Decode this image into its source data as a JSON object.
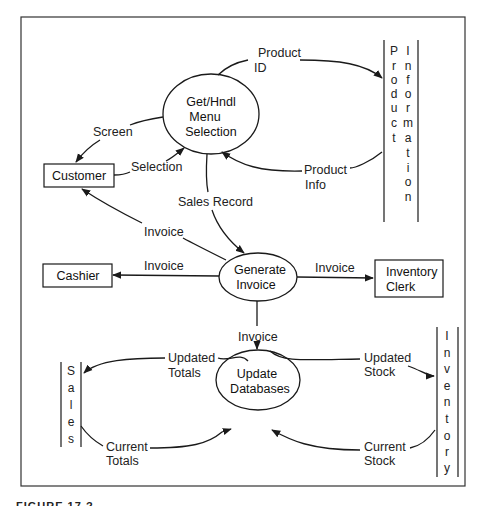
{
  "diagram": {
    "type": "data-flow-diagram",
    "processes": [
      {
        "id": "p1",
        "lines": [
          "Get/Hndl",
          "Menu",
          "Selection"
        ]
      },
      {
        "id": "p2",
        "lines": [
          "Generate",
          "Invoice"
        ]
      },
      {
        "id": "p3",
        "lines": [
          "Update",
          "Databases"
        ]
      }
    ],
    "entities": [
      {
        "id": "customer",
        "lines": [
          "Customer"
        ]
      },
      {
        "id": "cashier",
        "lines": [
          "Cashier"
        ]
      },
      {
        "id": "inventory_clerk",
        "lines": [
          "Inventory",
          "Clerk"
        ]
      }
    ],
    "stores": [
      {
        "id": "product_information",
        "columns": [
          [
            "P",
            "r",
            "o",
            "d",
            "u",
            "c",
            "t"
          ],
          [
            "I",
            "n",
            "f",
            "o",
            "r",
            "m",
            "a",
            "t",
            "i",
            "o",
            "n"
          ]
        ]
      },
      {
        "id": "sales",
        "columns": [
          [
            "S",
            "a",
            "l",
            "e",
            "s"
          ]
        ]
      },
      {
        "id": "inventory",
        "columns": [
          [
            "I",
            "n",
            "v",
            "e",
            "n",
            "t",
            "o",
            "r",
            "y"
          ]
        ]
      }
    ],
    "flows": [
      {
        "from": "p1",
        "to": "product_information",
        "lines": [
          "Product",
          "ID"
        ]
      },
      {
        "from": "product_information",
        "to": "p1",
        "lines": [
          "Product",
          "Info"
        ]
      },
      {
        "from": "p1",
        "to": "customer",
        "lines": [
          "Screen"
        ]
      },
      {
        "from": "customer",
        "to": "p1",
        "lines": [
          "Selection"
        ]
      },
      {
        "from": "p1",
        "to": "p2",
        "lines": [
          "Sales Record"
        ]
      },
      {
        "from": "p2",
        "to": "customer",
        "lines": [
          "Invoice"
        ]
      },
      {
        "from": "p2",
        "to": "cashier",
        "lines": [
          "Invoice"
        ]
      },
      {
        "from": "p2",
        "to": "inventory_clerk",
        "lines": [
          "Invoice"
        ]
      },
      {
        "from": "p2",
        "to": "p3",
        "lines": [
          "Invoice"
        ]
      },
      {
        "from": "p3",
        "to": "sales",
        "lines": [
          "Updated",
          "Totals"
        ]
      },
      {
        "from": "sales",
        "to": "p3",
        "lines": [
          "Current",
          "Totals"
        ]
      },
      {
        "from": "p3",
        "to": "inventory",
        "lines": [
          "Updated",
          "Stock"
        ]
      },
      {
        "from": "inventory",
        "to": "p3",
        "lines": [
          "Current",
          "Stock"
        ]
      }
    ]
  },
  "caption": "FIGURE 17.?"
}
